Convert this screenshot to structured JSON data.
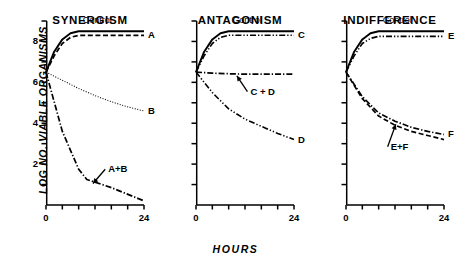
{
  "figure": {
    "xlabel": "HOURS",
    "ylabel": "LOG NO. VIABLE ORGANISMS"
  },
  "chart_data": {
    "type": "line",
    "title": "",
    "xlabel": "HOURS",
    "ylabel": "LOG NO. VIABLE ORGANISMS",
    "xlim": [
      0,
      24
    ],
    "ylim": [
      0,
      9
    ],
    "xticks": [
      0,
      24
    ],
    "xtick_labels": [
      "0",
      "24"
    ],
    "xminor_ticks": [
      4,
      8,
      12,
      16,
      20
    ],
    "yticks": [
      2,
      4,
      6,
      8
    ],
    "ytick_labels": [
      "2",
      "4",
      "6",
      "8"
    ],
    "yminor_ticks": [
      1,
      3,
      5,
      7,
      9
    ],
    "grid": false,
    "legend": "inline-end-labels",
    "panels": [
      {
        "name": "synergism",
        "title": "SYNERGISM",
        "series": [
          {
            "name": "Control",
            "label": "Control",
            "label_position": "above-curve",
            "style": "solid",
            "x": [
              0,
              2,
              4,
              6,
              8,
              24
            ],
            "y": [
              6.5,
              7.5,
              8.1,
              8.4,
              8.5,
              8.5
            ]
          },
          {
            "name": "A",
            "label": "A",
            "label_position": "end",
            "style": "dashed",
            "x": [
              0,
              2,
              4,
              6,
              8,
              24
            ],
            "y": [
              6.5,
              7.3,
              7.9,
              8.2,
              8.3,
              8.3
            ]
          },
          {
            "name": "B",
            "label": "B",
            "label_position": "end",
            "style": "dotted",
            "x": [
              0,
              4,
              8,
              12,
              16,
              20,
              24
            ],
            "y": [
              6.5,
              6.1,
              5.7,
              5.35,
              5.05,
              4.8,
              4.6
            ]
          },
          {
            "name": "A+B",
            "label": "A+B",
            "label_position": "annotation",
            "style": "dashdot",
            "x": [
              0,
              4,
              8,
              10,
              16,
              24
            ],
            "y": [
              6.5,
              3.6,
              1.75,
              1.25,
              0.85,
              0.2
            ]
          }
        ]
      },
      {
        "name": "antagonism",
        "title": "ANTAGONISM",
        "series": [
          {
            "name": "Control",
            "label": "Control",
            "label_position": "above-curve",
            "style": "solid",
            "x": [
              0,
              2,
              4,
              6,
              8,
              24
            ],
            "y": [
              6.5,
              7.5,
              8.1,
              8.4,
              8.5,
              8.5
            ]
          },
          {
            "name": "C",
            "label": "C",
            "label_position": "end",
            "style": "dashdotdot",
            "x": [
              0,
              2,
              4,
              6,
              8,
              24
            ],
            "y": [
              6.5,
              7.3,
              7.9,
              8.2,
              8.3,
              8.3
            ]
          },
          {
            "name": "C + D",
            "label": "C + D",
            "label_position": "annotation",
            "style": "dashdot",
            "x": [
              0,
              4,
              8,
              12,
              16,
              20,
              24
            ],
            "y": [
              6.5,
              6.45,
              6.42,
              6.4,
              6.4,
              6.4,
              6.4
            ]
          },
          {
            "name": "D",
            "label": "D",
            "label_position": "end",
            "style": "dashdotdot",
            "x": [
              0,
              4,
              8,
              12,
              16,
              20,
              24
            ],
            "y": [
              6.5,
              5.5,
              4.7,
              4.2,
              3.85,
              3.5,
              3.2
            ]
          }
        ]
      },
      {
        "name": "indifference",
        "title": "INDIFFERENCE",
        "series": [
          {
            "name": "Control",
            "label": "Control",
            "label_position": "above-curve",
            "style": "solid",
            "x": [
              0,
              2,
              4,
              6,
              8,
              24
            ],
            "y": [
              6.5,
              7.5,
              8.1,
              8.4,
              8.5,
              8.5
            ]
          },
          {
            "name": "E",
            "label": "E",
            "label_position": "end",
            "style": "dashdotdot",
            "x": [
              0,
              2,
              4,
              6,
              8,
              24
            ],
            "y": [
              6.5,
              7.3,
              7.9,
              8.15,
              8.25,
              8.25
            ]
          },
          {
            "name": "F",
            "label": "F",
            "label_position": "end",
            "style": "dashdot",
            "x": [
              0,
              4,
              8,
              12,
              16,
              20,
              24
            ],
            "y": [
              6.5,
              5.3,
              4.5,
              4.1,
              3.8,
              3.6,
              3.45
            ]
          },
          {
            "name": "E+F",
            "label": "E+F",
            "label_position": "annotation",
            "style": "dashed",
            "x": [
              0,
              4,
              8,
              12,
              16,
              20,
              24
            ],
            "y": [
              6.5,
              5.2,
              4.35,
              3.9,
              3.6,
              3.4,
              3.2
            ]
          }
        ]
      }
    ]
  }
}
